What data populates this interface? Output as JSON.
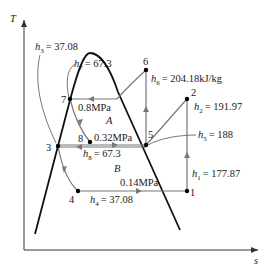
{
  "axes": {
    "y_label": "T",
    "x_label": "s"
  },
  "states": [
    {
      "id": "1",
      "label": "1",
      "enthalpy_label": "h",
      "enthalpy_sub": "1",
      "enthalpy_value": "= 177.87"
    },
    {
      "id": "2",
      "label": "2",
      "enthalpy_label": "h",
      "enthalpy_sub": "2",
      "enthalpy_value": "= 191.97"
    },
    {
      "id": "3",
      "label": "3",
      "enthalpy_label": "h",
      "enthalpy_sub": "3",
      "enthalpy_value": "= 37.08"
    },
    {
      "id": "4",
      "label": "4",
      "enthalpy_label": "h",
      "enthalpy_sub": "4",
      "enthalpy_value": "= 37.08"
    },
    {
      "id": "5",
      "label": "5",
      "enthalpy_label": "h",
      "enthalpy_sub": "5",
      "enthalpy_value": "= 188"
    },
    {
      "id": "6",
      "label": "6",
      "enthalpy_label": "h",
      "enthalpy_sub": "6",
      "enthalpy_value": "= 204.18kJ/kg"
    },
    {
      "id": "7",
      "label": "7",
      "enthalpy_label": "h",
      "enthalpy_sub": "7",
      "enthalpy_value": "= 67.3"
    },
    {
      "id": "8",
      "label": "8",
      "enthalpy_label": "h",
      "enthalpy_sub": "8",
      "enthalpy_value": "= 67.3"
    }
  ],
  "pressures": {
    "high": "0.8MPa",
    "mid": "0.32MPa",
    "low": "0.14MPa"
  },
  "regions": {
    "a": "A",
    "b": "B"
  }
}
